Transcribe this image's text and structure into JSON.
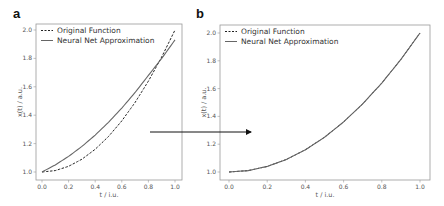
{
  "chart_data": [
    {
      "type": "line",
      "panel_label": "a",
      "xlabel": "t / i.u.",
      "ylabel": "x(t) / a.u.",
      "xlim": [
        0.0,
        1.0
      ],
      "ylim": [
        1.0,
        2.0
      ],
      "xticks": [
        "0.0",
        "0.2",
        "0.4",
        "0.6",
        "0.8",
        "1.0"
      ],
      "yticks": [
        "1.0",
        "1.2",
        "1.4",
        "1.6",
        "1.8",
        "2.0"
      ],
      "grid": false,
      "legend_position": "upper left",
      "x": [
        0.0,
        0.1,
        0.2,
        0.3,
        0.4,
        0.5,
        0.6,
        0.7,
        0.8,
        0.9,
        1.0
      ],
      "series": [
        {
          "name": "Original Function",
          "style": "dashed",
          "values": [
            1.0,
            1.01,
            1.04,
            1.09,
            1.16,
            1.25,
            1.36,
            1.49,
            1.64,
            1.81,
            2.0
          ]
        },
        {
          "name": "Neural Net Approximation",
          "style": "solid",
          "values": [
            1.0,
            1.05,
            1.11,
            1.18,
            1.26,
            1.35,
            1.45,
            1.56,
            1.68,
            1.8,
            1.93
          ]
        }
      ]
    },
    {
      "type": "line",
      "panel_label": "b",
      "xlabel": "t / i.u.",
      "ylabel": "x(t) / a.u.",
      "xlim": [
        0.0,
        1.0
      ],
      "ylim": [
        1.0,
        2.0
      ],
      "xticks": [
        "0.0",
        "0.2",
        "0.4",
        "0.6",
        "0.8",
        "1.0"
      ],
      "yticks": [
        "1.0",
        "1.2",
        "1.4",
        "1.6",
        "1.8",
        "2.0"
      ],
      "grid": false,
      "legend_position": "upper left",
      "x": [
        0.0,
        0.1,
        0.2,
        0.3,
        0.4,
        0.5,
        0.6,
        0.7,
        0.8,
        0.9,
        1.0
      ],
      "series": [
        {
          "name": "Original Function",
          "style": "dashed",
          "values": [
            1.0,
            1.01,
            1.04,
            1.09,
            1.16,
            1.25,
            1.36,
            1.49,
            1.64,
            1.81,
            2.0
          ]
        },
        {
          "name": "Neural Net Approximation",
          "style": "solid",
          "values": [
            1.0,
            1.01,
            1.04,
            1.09,
            1.16,
            1.25,
            1.36,
            1.49,
            1.64,
            1.81,
            2.0
          ]
        }
      ]
    }
  ],
  "annotations": {
    "arrow": "from panel a to panel b"
  }
}
